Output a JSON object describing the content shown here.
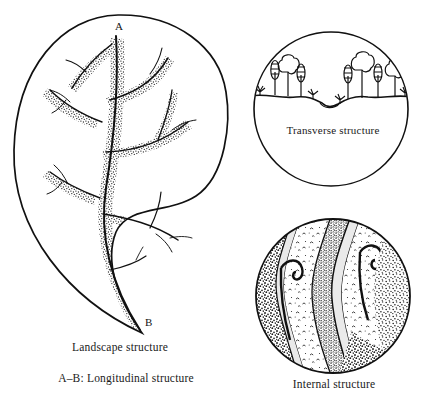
{
  "figure": {
    "title_cropped": "",
    "background_color": "#ffffff",
    "ink_color": "#141414",
    "width": 427,
    "height": 409
  },
  "panels": {
    "landscape": {
      "caption": "Landscape structure",
      "secondary_caption": "A–B: Longitudinal structure",
      "marker_top": "A",
      "marker_bottom": "B",
      "shape": "leaf-outline",
      "content": "dendritic drainage network with stippled riparian corridors"
    },
    "transverse": {
      "caption": "Transverse structure",
      "shape": "circle",
      "content": "ground profile line with conifer and broadleaf trees and shrubs on both sides of a central depression"
    },
    "internal": {
      "caption": "Internal structure",
      "shape": "circle",
      "content": "wavy vertical bands of contrasting stipple textures separated by light channels"
    }
  },
  "icons": {
    "leaf_outline": "leaf-outline-icon",
    "river_network": "river-network-icon",
    "tree_conifer": "conifer-tree-icon",
    "tree_broadleaf": "broadleaf-tree-icon",
    "shrub": "shrub-icon",
    "ground_line": "ground-line-icon",
    "texture_band": "texture-band-icon"
  }
}
